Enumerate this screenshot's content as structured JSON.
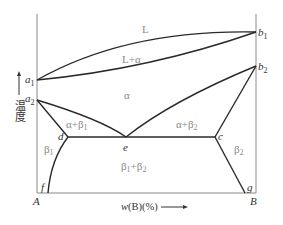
{
  "diagram": {
    "type": "binary phase diagram",
    "x_axis": {
      "label": "w(B)(%)",
      "left_end": "A",
      "right_end": "B"
    },
    "y_axis": {
      "label": "温度"
    },
    "points": {
      "a1": {
        "label": "a",
        "sub": "1"
      },
      "a2": {
        "label": "a",
        "sub": "2"
      },
      "b1": {
        "label": "b",
        "sub": "1"
      },
      "b2": {
        "label": "b",
        "sub": "2"
      },
      "d": {
        "label": "d"
      },
      "e": {
        "label": "e"
      },
      "c": {
        "label": "c"
      },
      "f": {
        "label": "f"
      },
      "g": {
        "label": "g"
      }
    },
    "regions": {
      "liquid": "L",
      "liquid_alpha": "L+α",
      "alpha": "α",
      "alpha_beta1": {
        "main": "α+β",
        "sub": "1"
      },
      "alpha_beta2": {
        "main": "α+β",
        "sub": "2"
      },
      "beta1": {
        "main": "β",
        "sub": "1"
      },
      "beta2": {
        "main": "β",
        "sub": "2"
      },
      "beta1_beta2": {
        "main1": "β",
        "sub1": "1",
        "plus": "+β",
        "sub2": "2"
      }
    },
    "colors": {
      "line": "#2a2a2a",
      "axis": "#8a8a8a",
      "region_label": "#8a8a8a"
    }
  }
}
